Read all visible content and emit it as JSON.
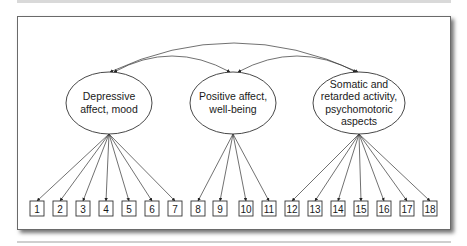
{
  "diagram": {
    "type": "factor-model",
    "colors": {
      "stroke": "#333333",
      "frame": "#6a6a6a",
      "background": "#ffffff"
    },
    "factors": [
      {
        "id": "f1",
        "lines": [
          "Depressive",
          "affect, mood"
        ],
        "cx": 109,
        "cy": 103,
        "rx": 43,
        "ry": 31,
        "items": [
          1,
          2,
          3,
          4,
          5,
          6,
          7
        ]
      },
      {
        "id": "f2",
        "lines": [
          "Positive affect,",
          "well-being"
        ],
        "cx": 233,
        "cy": 103,
        "rx": 43,
        "ry": 31,
        "items": [
          8,
          9,
          10,
          11
        ]
      },
      {
        "id": "f3",
        "lines": [
          "Somatic and",
          "retarded activity,",
          "psychomotoric",
          "aspects"
        ],
        "cx": 359,
        "cy": 103,
        "rx": 46,
        "ry": 31,
        "items": [
          12,
          13,
          14,
          15,
          16,
          17,
          18
        ]
      }
    ],
    "items": [
      {
        "label": "1",
        "x": 30
      },
      {
        "label": "2",
        "x": 53
      },
      {
        "label": "3",
        "x": 76
      },
      {
        "label": "4",
        "x": 99
      },
      {
        "label": "5",
        "x": 122
      },
      {
        "label": "6",
        "x": 145
      },
      {
        "label": "7",
        "x": 168
      },
      {
        "label": "8",
        "x": 191
      },
      {
        "label": "9",
        "x": 213
      },
      {
        "label": "10",
        "x": 239
      },
      {
        "label": "11",
        "x": 262
      },
      {
        "label": "12",
        "x": 285
      },
      {
        "label": "13",
        "x": 308
      },
      {
        "label": "14",
        "x": 331
      },
      {
        "label": "15",
        "x": 354
      },
      {
        "label": "16",
        "x": 377
      },
      {
        "label": "17",
        "x": 400
      },
      {
        "label": "18",
        "x": 423
      }
    ],
    "covariances": [
      {
        "from": "f1",
        "to": "f2"
      },
      {
        "from": "f2",
        "to": "f3"
      },
      {
        "from": "f1",
        "to": "f3"
      }
    ]
  }
}
